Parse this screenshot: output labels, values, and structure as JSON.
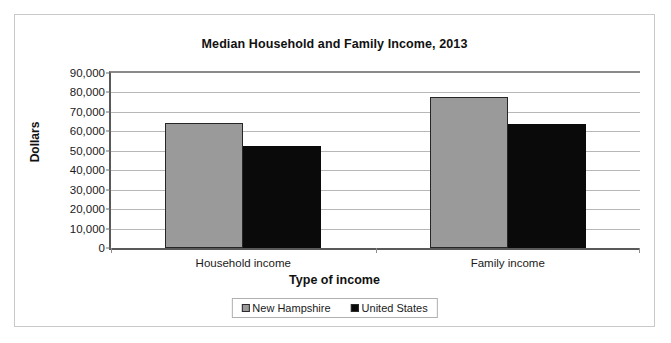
{
  "chart_data": {
    "type": "bar",
    "title": "Median Household and Family Income, 2013",
    "xlabel": "Type of income",
    "ylabel": "Dollars",
    "categories": [
      "Household income",
      "Family income"
    ],
    "series": [
      {
        "name": "New Hampshire",
        "color": "#9a9a9a",
        "values": [
          64230,
          77500
        ]
      },
      {
        "name": "United States",
        "color": "#0a0a0a",
        "values": [
          52250,
          63800
        ]
      }
    ],
    "ylim": [
      0,
      90000
    ],
    "ytick_values": [
      0,
      10000,
      20000,
      30000,
      40000,
      50000,
      60000,
      70000,
      80000,
      90000
    ],
    "ytick_labels": [
      "0",
      "10,000",
      "20,000",
      "30,000",
      "40,000",
      "50,000",
      "60,000",
      "70,000",
      "80,000",
      "90,000"
    ],
    "grid": true,
    "legend_position": "bottom"
  }
}
